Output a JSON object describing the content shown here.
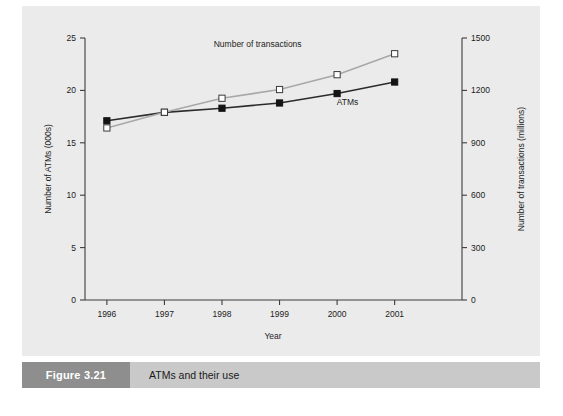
{
  "caption": {
    "number": "Figure 3.21",
    "title": "ATMs and their use",
    "number_block_color": "#8e8e8e",
    "bar_color": "#c9c9c9"
  },
  "panel": {
    "background_color": "#ebebeb"
  },
  "chart_data": {
    "type": "line",
    "title": "",
    "xlabel": "Year",
    "ylabel": "Number of ATMs (000s)",
    "y2label": "Number of transactions (millions)",
    "categories": [
      "1996",
      "1997",
      "1998",
      "1999",
      "2000",
      "2001"
    ],
    "x": [
      1996,
      1997,
      1998,
      1999,
      2000,
      2001
    ],
    "ylim": [
      0,
      25
    ],
    "y2lim": [
      0,
      1500
    ],
    "yticks": [
      "0",
      "5",
      "10",
      "15",
      "20",
      "25"
    ],
    "ytick_values": [
      0,
      5,
      10,
      15,
      20,
      25
    ],
    "y2ticks": [
      "0",
      "300",
      "600",
      "900",
      "1200",
      "1500"
    ],
    "y2tick_values": [
      0,
      300,
      600,
      900,
      1200,
      1500
    ],
    "grid": false,
    "legend": "inline-labels",
    "series": [
      {
        "name": "ATMs",
        "axis": "left",
        "units": "thousands",
        "color": "#2b2b2b",
        "marker": "filled-square",
        "label_x": 2000.18,
        "label_y": 18.6,
        "values": [
          17.1,
          17.9,
          18.3,
          18.8,
          19.7,
          20.8
        ]
      },
      {
        "name": "Number of transactions",
        "axis": "right",
        "units": "millions",
        "color": "#a8a8a8",
        "marker": "open-square",
        "label_x": 1998.62,
        "label_y": 24.1,
        "values": [
          985,
          1075,
          1155,
          1205,
          1290,
          1410
        ]
      }
    ]
  }
}
